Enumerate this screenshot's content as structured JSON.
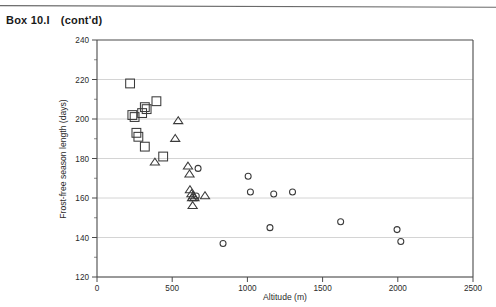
{
  "header": {
    "box_id": "Box 10.I",
    "continued": "(cont'd)"
  },
  "chart_data": {
    "type": "scatter",
    "title": "",
    "xlabel": "Altitude (m)",
    "ylabel": "Frost-free season length (days)",
    "xlim": [
      0,
      2500
    ],
    "ylim": [
      120,
      240
    ],
    "xticks": [
      0,
      500,
      1000,
      1500,
      2000,
      2500
    ],
    "xtick_labels": [
      "0",
      "500",
      "1000",
      "1500",
      "2000",
      "2500"
    ],
    "yticks": [
      120,
      140,
      160,
      180,
      200,
      220,
      240
    ],
    "ytick_labels": [
      "120",
      "140",
      "160",
      "180",
      "200",
      "220",
      "240"
    ],
    "y_minor_ticks": [
      130,
      150,
      170,
      190,
      210,
      230
    ],
    "grid": "horizontal",
    "legend": "none",
    "series": [
      {
        "name": "square-series",
        "marker": "square",
        "points": [
          [
            220,
            218
          ],
          [
            235,
            202
          ],
          [
            250,
            201
          ],
          [
            300,
            203
          ],
          [
            318,
            206
          ],
          [
            330,
            205
          ],
          [
            262,
            193
          ],
          [
            275,
            191
          ],
          [
            395,
            209
          ],
          [
            318,
            186
          ],
          [
            440,
            181
          ]
        ]
      },
      {
        "name": "triangle-series",
        "marker": "triangle",
        "points": [
          [
            385,
            178
          ],
          [
            540,
            199
          ],
          [
            520,
            190
          ],
          [
            605,
            176
          ],
          [
            615,
            172
          ],
          [
            618,
            164
          ],
          [
            628,
            162
          ],
          [
            632,
            160
          ],
          [
            640,
            161
          ],
          [
            648,
            160
          ],
          [
            636,
            156
          ],
          [
            718,
            161
          ]
        ]
      },
      {
        "name": "circle-series",
        "marker": "circle",
        "points": [
          [
            672,
            175
          ],
          [
            660,
            161
          ],
          [
            838,
            137
          ],
          [
            1005,
            171
          ],
          [
            1020,
            163
          ],
          [
            1150,
            145
          ],
          [
            1175,
            162
          ],
          [
            1300,
            163
          ],
          [
            1620,
            148
          ],
          [
            1995,
            144
          ],
          [
            2020,
            138
          ]
        ]
      }
    ]
  }
}
